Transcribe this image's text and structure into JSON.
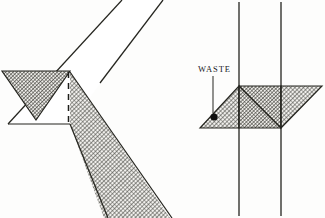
{
  "figure": {
    "background_color": "#fdfdfc",
    "ink_color": "#1f1f1d",
    "hatch_color": "#3a3a36",
    "canvas": {
      "width": 325,
      "height": 218
    },
    "annotations": {
      "waste_label": "WASTE"
    },
    "panels": [
      {
        "id": "left-panel",
        "name": "miter-fold-open-view",
        "description": "Diagonal band crossing with folded triangular flap and dashed fold line",
        "elements": [
          {
            "name": "diagonal-band-upper",
            "type": "band",
            "shaded": false,
            "points": "122,0 163,0 70,124 8,124"
          },
          {
            "name": "diagonal-band-lower-shaded",
            "type": "band",
            "shaded": true,
            "points": "70,72 163,218 100,218 70,124"
          },
          {
            "name": "folded-triangle-flap",
            "type": "triangle",
            "shaded": true,
            "points": "2,72 70,72 36,120"
          },
          {
            "name": "dashed-fold-line",
            "type": "dashed-line",
            "x1": 68,
            "y1": 73,
            "x2": 68,
            "y2": 123
          }
        ]
      },
      {
        "id": "right-panel",
        "name": "miter-fold-closed-view",
        "description": "Vertical band with folded shaded triangles and waste pointer",
        "elements": [
          {
            "name": "vertical-band-left-edge",
            "type": "line",
            "x1": 239,
            "y1": 2,
            "x2": 239,
            "y2": 216
          },
          {
            "name": "vertical-band-right-edge",
            "type": "line",
            "x1": 281,
            "y1": 2,
            "x2": 281,
            "y2": 216
          },
          {
            "name": "waste-triangle-shaded",
            "type": "triangle",
            "shaded": true,
            "points": "200,128 239,86 239,128"
          },
          {
            "name": "center-square-shaded",
            "type": "quad",
            "shaded": true,
            "points": "239,86 281,86 281,128 239,128"
          },
          {
            "name": "center-diagonal-fold",
            "type": "line",
            "x1": 239,
            "y1": 86,
            "x2": 281,
            "y2": 128
          },
          {
            "name": "right-tip-triangle-shaded",
            "type": "triangle",
            "shaded": true,
            "points": "281,86 322,86 281,128"
          },
          {
            "name": "waste-leader-line",
            "type": "line",
            "x1": 213,
            "y1": 76,
            "x2": 213,
            "y2": 114
          },
          {
            "name": "waste-pointer-dot",
            "type": "dot",
            "cx": 214,
            "cy": 117,
            "r": 3.6
          }
        ]
      }
    ]
  }
}
